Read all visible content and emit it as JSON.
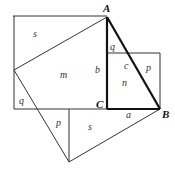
{
  "diagram": {
    "type": "pythagorean-dissection",
    "vertices": {
      "A": "A",
      "B": "B",
      "C": "C"
    },
    "labels": {
      "s_top": "s",
      "m": "m",
      "b": "b",
      "q_top": "q",
      "c": "c",
      "p_right": "p",
      "n": "n",
      "q_left": "q",
      "p_bottom": "p",
      "s_bottom": "s",
      "a": "a"
    },
    "colors": {
      "line": "#222222",
      "label": "#333333",
      "background": "#ffffff"
    }
  }
}
